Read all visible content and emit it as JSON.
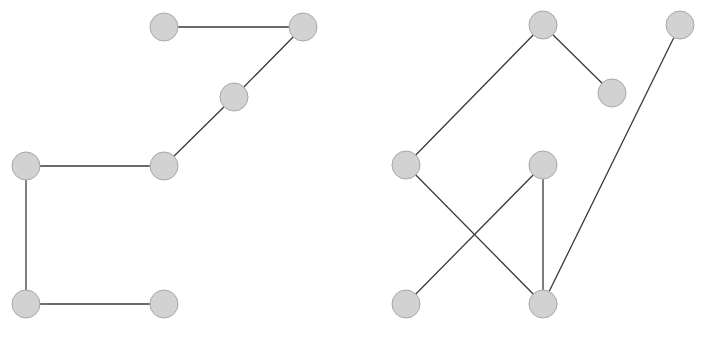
{
  "style": {
    "node_fill": "#d2d2d2",
    "node_stroke": "#a8a8a8",
    "edge_color": "#3a3a3a",
    "node_radius": 14
  },
  "graphs": [
    {
      "name": "left-graph",
      "nodes": [
        {
          "id": "A",
          "x": 164,
          "y": 27
        },
        {
          "id": "B",
          "x": 303,
          "y": 27
        },
        {
          "id": "C",
          "x": 234,
          "y": 97
        },
        {
          "id": "D",
          "x": 164,
          "y": 166
        },
        {
          "id": "E",
          "x": 26,
          "y": 166
        },
        {
          "id": "F",
          "x": 26,
          "y": 304
        },
        {
          "id": "G",
          "x": 164,
          "y": 304
        }
      ],
      "edges": [
        [
          "A",
          "B"
        ],
        [
          "B",
          "C"
        ],
        [
          "C",
          "D"
        ],
        [
          "D",
          "E"
        ],
        [
          "E",
          "F"
        ],
        [
          "F",
          "G"
        ]
      ]
    },
    {
      "name": "right-graph",
      "nodes": [
        {
          "id": "H",
          "x": 543,
          "y": 25
        },
        {
          "id": "I",
          "x": 680,
          "y": 25
        },
        {
          "id": "J",
          "x": 612,
          "y": 93
        },
        {
          "id": "K",
          "x": 406,
          "y": 165
        },
        {
          "id": "L",
          "x": 543,
          "y": 165
        },
        {
          "id": "M",
          "x": 406,
          "y": 304
        },
        {
          "id": "N",
          "x": 543,
          "y": 304
        }
      ],
      "edges": [
        [
          "H",
          "K"
        ],
        [
          "H",
          "J"
        ],
        [
          "I",
          "N"
        ],
        [
          "K",
          "N"
        ],
        [
          "L",
          "M"
        ],
        [
          "L",
          "N"
        ]
      ]
    }
  ]
}
